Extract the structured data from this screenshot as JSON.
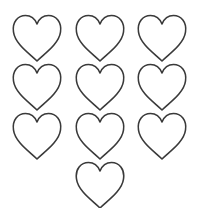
{
  "page": {
    "background": "#ffffff",
    "stroke_color": "#3a3a3a"
  },
  "hearts": [
    {
      "row": 1,
      "col": 1,
      "x": 12,
      "y": 14,
      "icon": "heart-outline-icon"
    },
    {
      "row": 1,
      "col": 2,
      "x": 75,
      "y": 14,
      "icon": "heart-outline-icon"
    },
    {
      "row": 1,
      "col": 3,
      "x": 137,
      "y": 14,
      "icon": "heart-outline-icon"
    },
    {
      "row": 2,
      "col": 1,
      "x": 12,
      "y": 63,
      "icon": "heart-outline-icon"
    },
    {
      "row": 2,
      "col": 2,
      "x": 75,
      "y": 63,
      "icon": "heart-outline-icon"
    },
    {
      "row": 2,
      "col": 3,
      "x": 137,
      "y": 63,
      "icon": "heart-outline-icon"
    },
    {
      "row": 3,
      "col": 1,
      "x": 12,
      "y": 112,
      "icon": "heart-outline-icon"
    },
    {
      "row": 3,
      "col": 2,
      "x": 75,
      "y": 112,
      "icon": "heart-outline-icon"
    },
    {
      "row": 3,
      "col": 3,
      "x": 137,
      "y": 112,
      "icon": "heart-outline-icon"
    },
    {
      "row": 4,
      "col": 2,
      "x": 75,
      "y": 161,
      "icon": "heart-outline-icon"
    }
  ]
}
